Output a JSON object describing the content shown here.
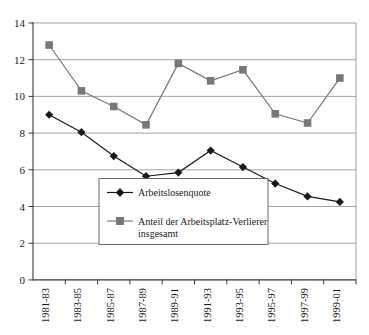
{
  "chart_data": {
    "type": "line",
    "title": "",
    "subtitle": "",
    "xlabel": "",
    "ylabel": "",
    "categories": [
      "1981-83",
      "1983-85",
      "1985-87",
      "1987-89",
      "1989-91",
      "1991-93",
      "1993-95",
      "1995-97",
      "1997-99",
      "1999-01"
    ],
    "series": [
      {
        "name": "Arbeitslosenquote",
        "marker": "diamond",
        "color": "#1a1a1a",
        "values": [
          9.0,
          8.05,
          6.75,
          5.65,
          5.85,
          7.05,
          6.15,
          5.25,
          4.55,
          4.25
        ]
      },
      {
        "name": "Anteil der Arbeitsplatz-Verlierer insgesamt",
        "marker": "square",
        "color": "#787878",
        "values": [
          12.8,
          10.3,
          9.45,
          8.45,
          11.8,
          10.85,
          11.45,
          9.05,
          8.55,
          11.0
        ]
      }
    ],
    "ylim": [
      0,
      14
    ],
    "yticks": [
      0,
      2,
      4,
      6,
      8,
      10,
      12,
      14
    ],
    "ytick_labels": [
      "0",
      "2",
      "4",
      "6",
      "8",
      "10",
      "12",
      "14"
    ],
    "grid": true,
    "grid_axis": "y",
    "legend_position": "center",
    "legend": [
      {
        "label": "Arbeitslosenquote",
        "marker": "diamond",
        "color": "#1a1a1a"
      },
      {
        "label_line1": "Anteil der Arbeitsplatz-Verlierer",
        "label_line2": "insgesamt",
        "marker": "square",
        "color": "#787878"
      }
    ]
  },
  "colors": {
    "series_unemployment": "#1a1a1a",
    "series_joblosers": "#787878",
    "gridline": "#8c8c8c",
    "axis": "#3a3a3a",
    "background": "#ffffff"
  }
}
